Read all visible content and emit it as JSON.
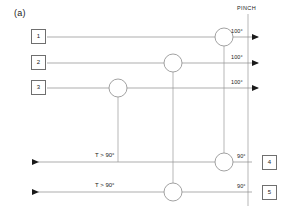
{
  "figure": {
    "panel_label": "(a)",
    "pinch_label": "PINCH",
    "colors": {
      "line": "#8a8a8a",
      "box_border": "#6f6f6f",
      "text": "#1a1a1a",
      "arrow": "#1a1a1a",
      "background": "#ffffff"
    }
  },
  "hot_streams": [
    {
      "id": "1",
      "box_label": "1",
      "temperature": "100°",
      "y": 37
    },
    {
      "id": "2",
      "box_label": "2",
      "temperature": "100°",
      "y": 63
    },
    {
      "id": "3",
      "box_label": "3",
      "temperature": "100°",
      "y": 88
    }
  ],
  "cold_streams": [
    {
      "id": "4",
      "box_label": "4",
      "temperature": "90°",
      "duty": "T > 90°",
      "y": 162
    },
    {
      "id": "5",
      "box_label": "5",
      "temperature": "90°",
      "duty": "T > 90°",
      "y": 192
    }
  ],
  "exchangers": [
    {
      "name": "exchanger-a-top",
      "cx": 224,
      "cy": 37,
      "r": 9
    },
    {
      "name": "exchanger-b-top",
      "cx": 173,
      "cy": 63,
      "r": 9
    },
    {
      "name": "exchanger-c-top",
      "cx": 118,
      "cy": 88,
      "r": 9
    },
    {
      "name": "exchanger-a-bottom",
      "cx": 224,
      "cy": 162,
      "r": 9
    },
    {
      "name": "exchanger-b-bottom",
      "cx": 173,
      "cy": 192,
      "r": 9
    }
  ],
  "match_links": [
    {
      "name": "match-link-a",
      "x": 224,
      "y1": 46,
      "y2": 153
    },
    {
      "name": "match-link-b",
      "x": 173,
      "y1": 72,
      "y2": 183
    },
    {
      "name": "match-link-c",
      "x": 118,
      "y1": 97,
      "y2": 162
    }
  ],
  "pinch_line": {
    "x": 248,
    "y1": 14,
    "y2": 206
  }
}
